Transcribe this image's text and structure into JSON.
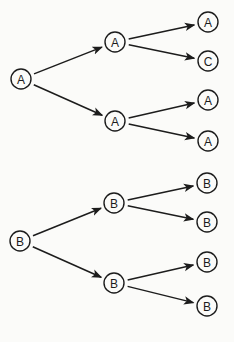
{
  "diagram": {
    "type": "tree",
    "colors": {
      "stroke": "#1c1c1c",
      "background": "#fbfbf9"
    },
    "trees": [
      {
        "name": "tree-a",
        "nodes": [
          {
            "id": "a0",
            "label": "A",
            "x": 21,
            "y": 79
          },
          {
            "id": "a1",
            "label": "A",
            "x": 115,
            "y": 42
          },
          {
            "id": "a2",
            "label": "A",
            "x": 115,
            "y": 121
          },
          {
            "id": "a11",
            "label": "A",
            "x": 208,
            "y": 22
          },
          {
            "id": "a12",
            "label": "C",
            "x": 208,
            "y": 61
          },
          {
            "id": "a21",
            "label": "A",
            "x": 208,
            "y": 100
          },
          {
            "id": "a22",
            "label": "A",
            "x": 208,
            "y": 141
          }
        ],
        "edges": [
          [
            "a0",
            "a1"
          ],
          [
            "a0",
            "a2"
          ],
          [
            "a1",
            "a11"
          ],
          [
            "a1",
            "a12"
          ],
          [
            "a2",
            "a21"
          ],
          [
            "a2",
            "a22"
          ]
        ]
      },
      {
        "name": "tree-b",
        "nodes": [
          {
            "id": "b0",
            "label": "B",
            "x": 20,
            "y": 241
          },
          {
            "id": "b1",
            "label": "B",
            "x": 114,
            "y": 203
          },
          {
            "id": "b2",
            "label": "B",
            "x": 114,
            "y": 283
          },
          {
            "id": "b11",
            "label": "B",
            "x": 207,
            "y": 183
          },
          {
            "id": "b12",
            "label": "B",
            "x": 207,
            "y": 222
          },
          {
            "id": "b21",
            "label": "B",
            "x": 207,
            "y": 262
          },
          {
            "id": "b22",
            "label": "B",
            "x": 207,
            "y": 306
          }
        ],
        "edges": [
          [
            "b0",
            "b1"
          ],
          [
            "b0",
            "b2"
          ],
          [
            "b1",
            "b11"
          ],
          [
            "b1",
            "b12"
          ],
          [
            "b2",
            "b21"
          ],
          [
            "b2",
            "b22"
          ]
        ]
      }
    ]
  }
}
